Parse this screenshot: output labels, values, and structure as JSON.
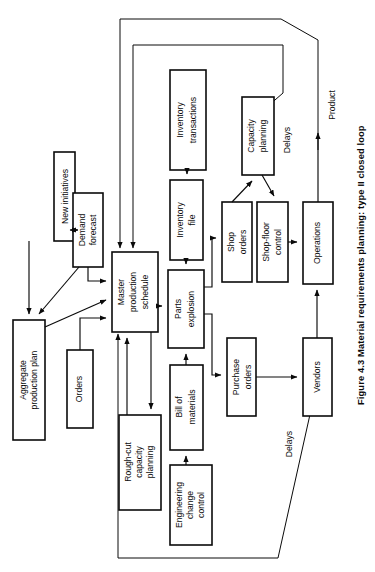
{
  "figure": {
    "caption": "Figure 4.3 Material requirements planning: type II closed loop",
    "orientation": "rotated-90-ccw",
    "diagram_type": "flowchart",
    "background_color": "#ffffff",
    "line_color": "#0a0a0a"
  },
  "nodes": {
    "new_initiatives": "New initiatives",
    "demand_forecast": "Demand\nforecast",
    "demand_forecast_l1": "Demand",
    "demand_forecast_l2": "forecast",
    "aggregate_production_plan_l1": "Aggregate",
    "aggregate_production_plan_l2": "production plan",
    "orders": "Orders",
    "master_production_schedule_l1": "Master",
    "master_production_schedule_l2": "production",
    "master_production_schedule_l3": "schedule",
    "rough_cut_capacity_planning_l1": "Rough-cut",
    "rough_cut_capacity_planning_l2": "capacity",
    "rough_cut_capacity_planning_l3": "planning",
    "inventory_transactions_l1": "Inventory",
    "inventory_transactions_l2": "transactions",
    "inventory_file_l1": "Inventory",
    "inventory_file_l2": "file",
    "parts_explosion_l1": "Parts",
    "parts_explosion_l2": "explosion",
    "bill_of_materials_l1": "Bill of",
    "bill_of_materials_l2": "materials",
    "engineering_change_control_l1": "Engineering",
    "engineering_change_control_l2": "change",
    "engineering_change_control_l3": "control",
    "capacity_planning_l1": "Capacity",
    "capacity_planning_l2": "planning",
    "shop_orders_l1": "Shop",
    "shop_orders_l2": "orders",
    "shop_floor_control_l1": "Shop-floor",
    "shop_floor_control_l2": "control",
    "purchase_orders_l1": "Purchase",
    "purchase_orders_l2": "orders",
    "operations": "Operations",
    "vendors": "Vendors"
  },
  "free_labels": {
    "delays_upper": "Delays",
    "delays_lower": "Delays",
    "product": "Product"
  },
  "edges": [
    {
      "from": "new_initiatives",
      "to": "demand_forecast",
      "type": "bidirectional"
    },
    {
      "from": "new_initiatives",
      "to": "aggregate_production_plan",
      "type": "arrow"
    },
    {
      "from": "demand_forecast",
      "to": "aggregate_production_plan",
      "type": "arrow"
    },
    {
      "from": "demand_forecast",
      "to": "master_production_schedule",
      "type": "arrow"
    },
    {
      "from": "aggregate_production_plan",
      "to": "master_production_schedule",
      "type": "arrow"
    },
    {
      "from": "orders",
      "to": "master_production_schedule",
      "type": "arrow"
    },
    {
      "from": "master_production_schedule",
      "to": "rough_cut_capacity_planning",
      "type": "arrow"
    },
    {
      "from": "rough_cut_capacity_planning",
      "to": "master_production_schedule",
      "type": "arrow"
    },
    {
      "from": "master_production_schedule",
      "to": "parts_explosion",
      "type": "arrow"
    },
    {
      "from": "inventory_transactions",
      "to": "inventory_file",
      "type": "arrow"
    },
    {
      "from": "inventory_file",
      "to": "parts_explosion",
      "type": "arrow"
    },
    {
      "from": "bill_of_materials",
      "to": "parts_explosion",
      "type": "arrow"
    },
    {
      "from": "engineering_change_control",
      "to": "bill_of_materials",
      "type": "arrow"
    },
    {
      "from": "parts_explosion",
      "to": "shop_orders",
      "type": "arrow"
    },
    {
      "from": "parts_explosion",
      "to": "purchase_orders",
      "type": "arrow"
    },
    {
      "from": "shop_orders",
      "to": "capacity_planning",
      "type": "arrow"
    },
    {
      "from": "capacity_planning",
      "to": "shop_floor_control",
      "type": "arrow"
    },
    {
      "from": "shop_floor_control",
      "to": "operations",
      "type": "arrow"
    },
    {
      "from": "purchase_orders",
      "to": "vendors",
      "type": "arrow"
    },
    {
      "from": "vendors",
      "to": "operations",
      "type": "arrow"
    },
    {
      "from": "operations",
      "to": "product",
      "type": "arrow"
    },
    {
      "from": "operations",
      "to": "master_production_schedule",
      "type": "feedback-outer"
    },
    {
      "from": "capacity_planning",
      "to": "master_production_schedule",
      "type": "feedback-inner"
    },
    {
      "from": "vendors",
      "to": "master_production_schedule",
      "type": "feedback-lower"
    }
  ]
}
